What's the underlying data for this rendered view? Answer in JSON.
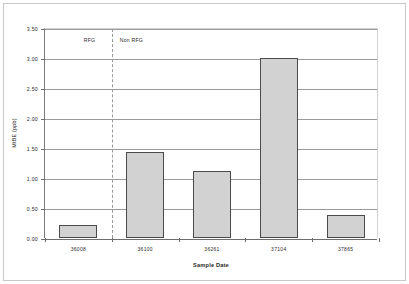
{
  "chart_data": {
    "type": "bar",
    "title": "",
    "xlabel": "Sample Date",
    "ylabel": "MtBE (ppb)",
    "categories": [
      "36008",
      "36100",
      "36261",
      "37104",
      "37865"
    ],
    "values": [
      0.22,
      1.43,
      1.12,
      3.0,
      0.39
    ],
    "ylim": [
      0.0,
      3.5
    ],
    "ytick_labels": [
      "0.00",
      "0.50",
      "1.00",
      "1.50",
      "2.00",
      "2.50",
      "3.00",
      "3.50"
    ],
    "ytick_values": [
      0.0,
      0.5,
      1.0,
      1.5,
      2.0,
      2.5,
      3.0,
      3.5
    ],
    "grid": true,
    "legend": "none",
    "annotations": [
      {
        "text": "RFG",
        "after_category_index": 0
      },
      {
        "text": "Non RFG",
        "after_category_index": 0
      }
    ],
    "series": [
      {
        "name": "MtBE",
        "values": [
          0.22,
          1.43,
          1.12,
          3.0,
          0.39
        ]
      }
    ],
    "colors": {
      "bar_fill": "#d2d2d2",
      "bar_border": "#4a4a4a",
      "gridline": "#9a9a9a",
      "axis": "#6e6e6e",
      "text": "#2b2b2b",
      "background": "#ffffff"
    }
  }
}
